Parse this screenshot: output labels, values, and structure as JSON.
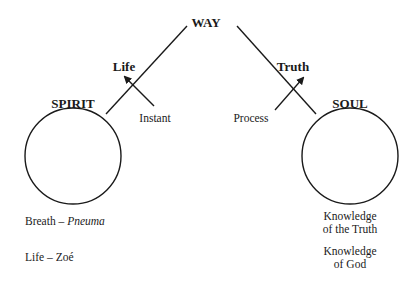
{
  "title": "WAY",
  "nodes": {
    "spirit": {
      "label": "SPIRIT"
    },
    "soul": {
      "label": "SOUL"
    }
  },
  "branches": {
    "left": {
      "label": "Life",
      "arrow_label": "Instant"
    },
    "right": {
      "label": "Truth",
      "arrow_label": "Process"
    }
  },
  "spirit_notes": [
    {
      "term": "Breath",
      "dash": "–",
      "greek": "Pneuma",
      "greek_italic": true
    },
    {
      "term": "Life",
      "dash": "–",
      "greek": "Zoé",
      "greek_italic": false
    }
  ],
  "soul_notes": [
    {
      "line1": "Knowledge",
      "line2": "of the Truth"
    },
    {
      "line1": "Knowledge",
      "line2": "of God"
    }
  ],
  "colors": {
    "line": "#1a1a1a",
    "background": "#ffffff"
  }
}
